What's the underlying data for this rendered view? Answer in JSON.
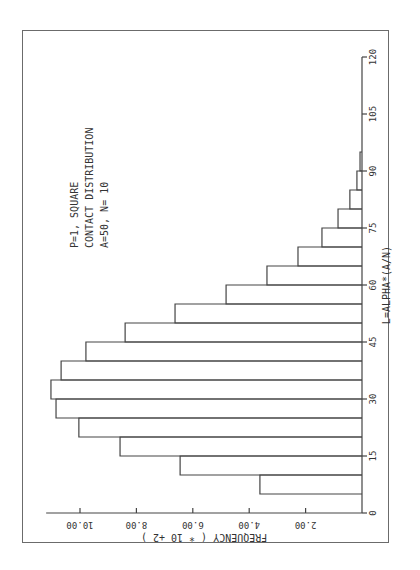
{
  "chart_data": {
    "type": "bar",
    "orientation_note": "histogram rotated 90 degrees counter-clockwise on the page",
    "annotation": [
      "P=1, SQUARE",
      "CONTACT DISTRIBUTION",
      "A=50, N=   10"
    ],
    "xlabel": "L=ALPHA*(A/N)",
    "ylabel": "FREQUENCY  ( * 10  +2 )",
    "xlim": [
      0,
      120
    ],
    "ylim": [
      0,
      11.2
    ],
    "xticks": [
      0,
      15,
      30,
      45,
      60,
      75,
      90,
      105,
      120
    ],
    "xtick_labels": [
      "0",
      "15",
      "30",
      "45",
      "60",
      "75",
      "90",
      "105",
      "120"
    ],
    "yticks": [
      2,
      4,
      6,
      8,
      10
    ],
    "ytick_labels": [
      "2.00",
      "4.00",
      "6.00",
      "8.00",
      "10.00"
    ],
    "grid": false,
    "bin_width": 5,
    "bin_starts": [
      5,
      10,
      15,
      20,
      25,
      30,
      35,
      40,
      45,
      50,
      55,
      60,
      65,
      70,
      75,
      80,
      85,
      90
    ],
    "values": [
      3.62,
      6.45,
      8.58,
      10.04,
      10.85,
      11.03,
      10.67,
      9.79,
      8.4,
      6.63,
      4.82,
      3.37,
      2.27,
      1.42,
      0.85,
      0.43,
      0.18,
      0.07
    ]
  }
}
